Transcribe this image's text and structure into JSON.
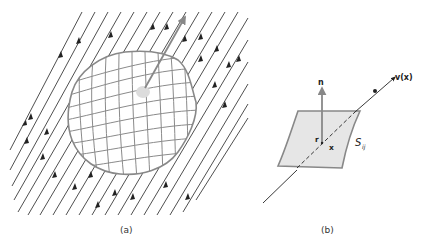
{
  "figure": {
    "panel_a": {
      "caption": "(a)",
      "description": "Parallel streamlines passing through a closed meshed surface with a normal vector",
      "streamline_count": 19,
      "colors": {
        "streamline": "#222222",
        "surface": "#888888",
        "normal_vector": "#888888"
      }
    },
    "panel_b": {
      "caption": "(b)",
      "normal_label": "n",
      "velocity_label": "v(x)",
      "point_label": "x",
      "offset_label": "r",
      "surface_label": "S",
      "surface_subscript": "ij",
      "colors": {
        "surface_fill": "#e6e6e6",
        "surface_stroke": "#888888",
        "line": "#222222"
      }
    }
  }
}
